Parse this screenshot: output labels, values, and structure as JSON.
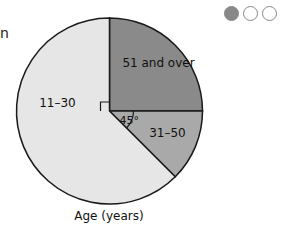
{
  "chart_data": {
    "type": "pie",
    "title": "",
    "xlabel": "Age (years)",
    "slices": [
      {
        "label": "51 and over",
        "angle_deg": 90,
        "color": "#8a8a8a"
      },
      {
        "label": "31–50",
        "angle_deg": 45,
        "color": "#a9a9a9"
      },
      {
        "label": "11–30",
        "angle_deg": 225,
        "color": "#e6e6e6"
      }
    ],
    "annotations": [
      {
        "type": "right-angle-marker",
        "slice": "51 and over"
      },
      {
        "type": "angle-label",
        "slice": "31–50",
        "text": "45°"
      }
    ]
  },
  "page": {
    "cut_text": "n",
    "pagination": {
      "total": 3,
      "active_index": 0,
      "active_color": "#888888"
    }
  }
}
